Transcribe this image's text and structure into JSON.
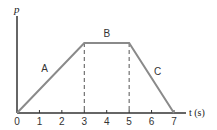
{
  "chart_data": {
    "type": "line",
    "title": "",
    "xlabel": "t (s)",
    "ylabel": "p",
    "xlim": [
      0,
      7
    ],
    "x_ticks": [
      "0",
      "1",
      "2",
      "3",
      "4",
      "5",
      "6",
      "7"
    ],
    "y_ticks": [],
    "grid": false,
    "series": [
      {
        "name": "p(t)",
        "points": [
          [
            0,
            0
          ],
          [
            3,
            1
          ],
          [
            5,
            1
          ],
          [
            7,
            0
          ]
        ],
        "color": "#8a8a8a"
      }
    ],
    "segment_labels": [
      {
        "label": "A",
        "x": 1.5
      },
      {
        "label": "B",
        "x": 4.0
      },
      {
        "label": "C",
        "x": 6.0
      }
    ],
    "dashed_verticals": [
      3,
      5
    ],
    "axis_color": "#333333"
  }
}
